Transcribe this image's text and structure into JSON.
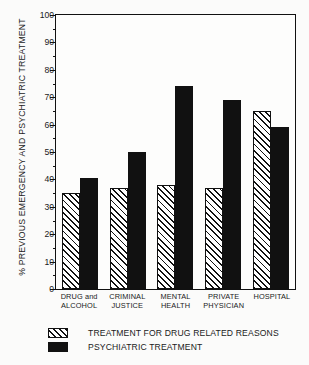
{
  "chart_data": {
    "type": "bar",
    "title": "",
    "xlabel": "",
    "ylabel": "% PREVIOUS EMERGENCY AND PSYCHIATRIC TREATMENT",
    "ylim": [
      0,
      100
    ],
    "ytick_step": 10,
    "yminor_step": 5,
    "grid": false,
    "legend_position": "below",
    "categories": [
      "DRUG and\nALCOHOL",
      "CRIMINAL\nJUSTICE",
      "MENTAL\nHEALTH",
      "PRIVATE\nPHYSICIAN",
      "HOSPITAL"
    ],
    "ytick_labels": [
      "0",
      "10",
      "20",
      "30",
      "40",
      "50",
      "60",
      "70",
      "80",
      "90",
      "100"
    ],
    "ytick_values": [
      0,
      10,
      20,
      30,
      40,
      50,
      60,
      70,
      80,
      90,
      100
    ],
    "yminor_values": [
      5,
      15,
      25,
      35,
      45,
      55,
      65,
      75,
      85,
      95
    ],
    "series": [
      {
        "name": "TREATMENT FOR DRUG RELATED REASONS",
        "fill": "hatch",
        "color": "#111111",
        "values": [
          35,
          37,
          38,
          37,
          65
        ]
      },
      {
        "name": "PSYCHIATRIC TREATMENT",
        "fill": "solid",
        "color": "#111111",
        "values": [
          40.5,
          50,
          74,
          69,
          59
        ]
      }
    ]
  },
  "legend": {
    "items": [
      {
        "label": "TREATMENT FOR DRUG RELATED REASONS",
        "fill": "hatch"
      },
      {
        "label": "PSYCHIATRIC TREATMENT",
        "fill": "solid"
      }
    ]
  }
}
